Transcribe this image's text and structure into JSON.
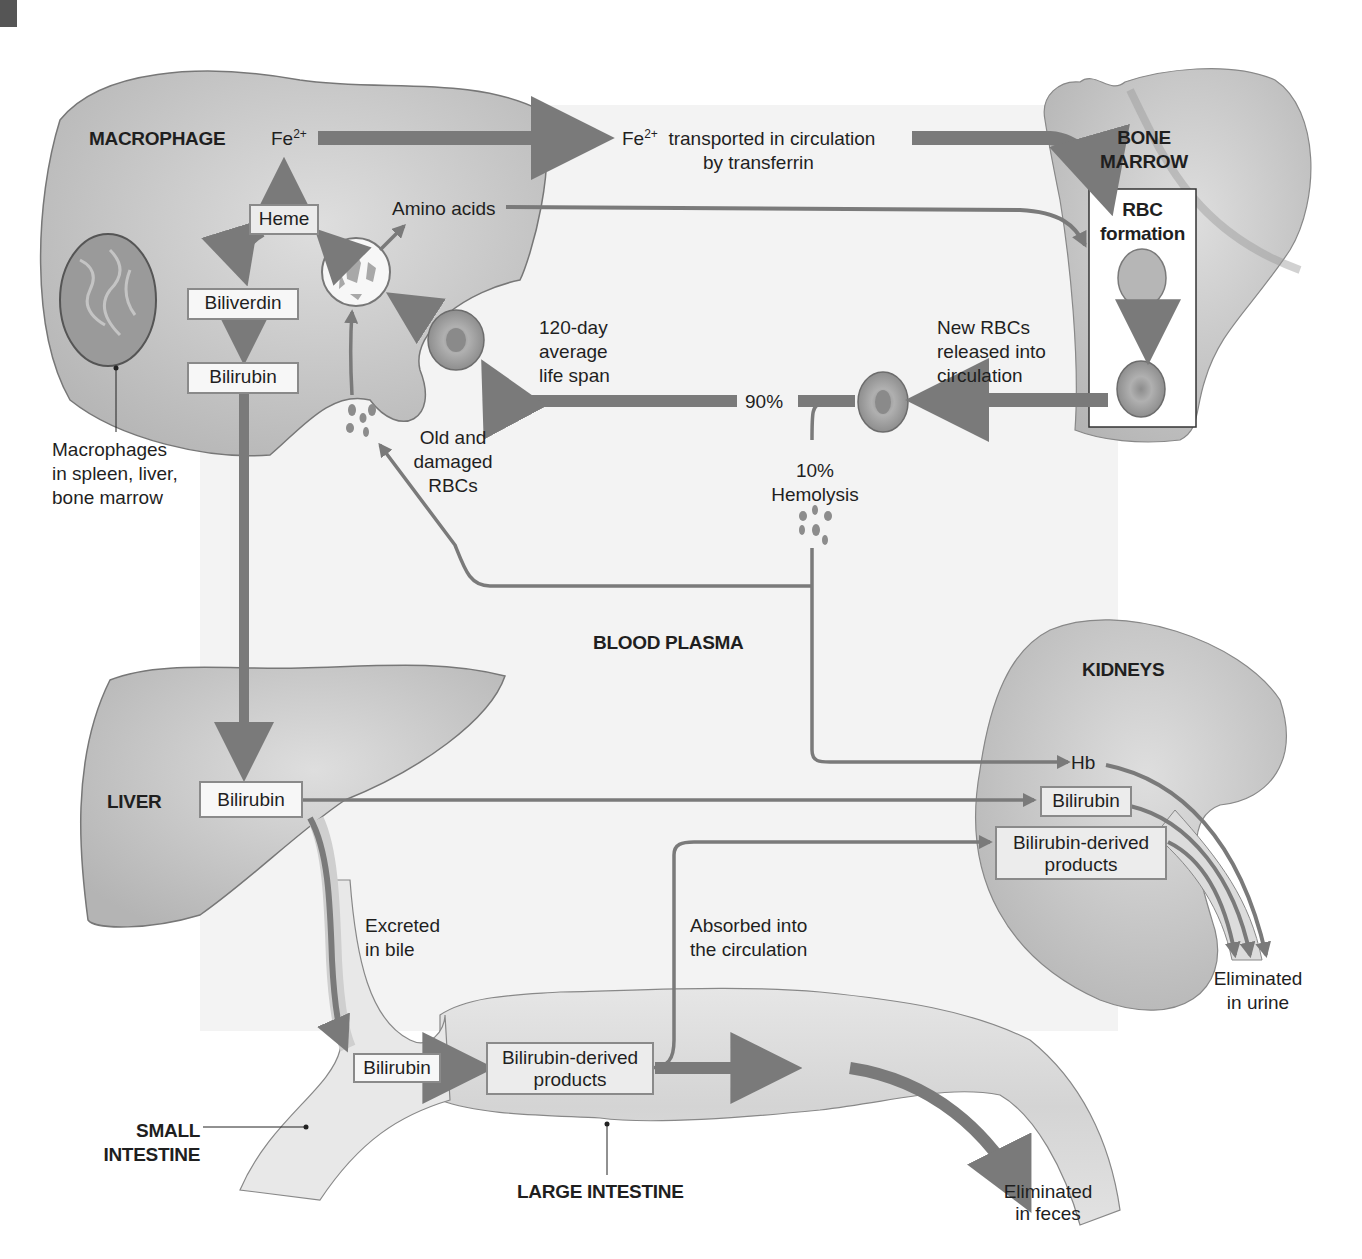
{
  "diagram": {
    "title_region": "BLOOD PLASMA",
    "organs": {
      "macrophage": "MACROPHAGE",
      "bone_marrow_line1": "BONE",
      "bone_marrow_line2": "MARROW",
      "liver": "LIVER",
      "kidneys": "KIDNEYS",
      "small_intestine_line1": "SMALL",
      "small_intestine_line2": "INTESTINE",
      "large_intestine": "LARGE INTESTINE"
    },
    "macrophage": {
      "fe_label": "Fe",
      "fe_charge": "2+",
      "heme": "Heme",
      "biliverdin": "Biliverdin",
      "bilirubin": "Bilirubin",
      "amino_acids": "Amino acids",
      "note_line1": "Macrophages",
      "note_line2": "in spleen, liver,",
      "note_line3": "bone marrow"
    },
    "circulation": {
      "fe_label": "Fe",
      "fe_charge": "2+",
      "transport_line1": "transported in circulation",
      "transport_line2": "by transferrin",
      "lifespan_line1": "120-day",
      "lifespan_line2": "average",
      "lifespan_line3": "life span",
      "pct_90": "90%",
      "pct_10": "10%",
      "hemolysis": "Hemolysis",
      "old_line1": "Old and",
      "old_line2": "damaged",
      "old_line3": "RBCs",
      "new_line1": "New RBCs",
      "new_line2": "released into",
      "new_line3": "circulation"
    },
    "bone_marrow": {
      "rbc_line1": "RBC",
      "rbc_line2": "formation"
    },
    "liver": {
      "bilirubin": "Bilirubin",
      "excreted_line1": "Excreted",
      "excreted_line2": "in bile"
    },
    "kidneys": {
      "hb": "Hb",
      "bilirubin": "Bilirubin",
      "derived_line1": "Bilirubin-derived",
      "derived_line2": "products",
      "eliminated_line1": "Eliminated",
      "eliminated_line2": "in urine"
    },
    "intestine": {
      "bilirubin": "Bilirubin",
      "derived_line1": "Bilirubin-derived",
      "derived_line2": "products",
      "absorbed_line1": "Absorbed into",
      "absorbed_line2": "the circulation",
      "eliminated_line1": "Eliminated",
      "eliminated_line2": "in feces"
    },
    "colors": {
      "arrow": "#7a7a7a",
      "organ_fill": "#c8c8c8",
      "plasma_bg": "#f3f3f3",
      "box_border": "#8a8a8a"
    }
  }
}
